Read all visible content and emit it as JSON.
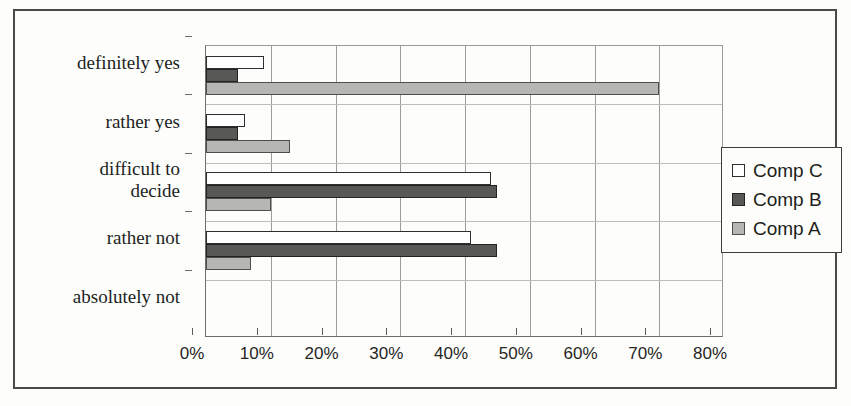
{
  "chart_data": {
    "type": "bar",
    "orientation": "horizontal",
    "title": "",
    "xlabel": "",
    "ylabel": "",
    "xlim": [
      0,
      80
    ],
    "xtick_labels": [
      "0%",
      "10%",
      "20%",
      "30%",
      "40%",
      "50%",
      "60%",
      "70%",
      "80%"
    ],
    "xtick_values": [
      0,
      10,
      20,
      30,
      40,
      50,
      60,
      70,
      80
    ],
    "grid": true,
    "grid_axis": "x",
    "legend_position": "right",
    "categories": [
      "definitely yes",
      "rather yes",
      "difficult to decide",
      "rather not",
      "absolutely not"
    ],
    "series": [
      {
        "name": "Comp C",
        "color": "#fefefe",
        "values": [
          9,
          6,
          44,
          41,
          0
        ]
      },
      {
        "name": "Comp B",
        "color": "#585856",
        "values": [
          5,
          5,
          45,
          45,
          0
        ]
      },
      {
        "name": "Comp A",
        "color": "#b6b6b2",
        "values": [
          70,
          13,
          10,
          7,
          0
        ]
      }
    ]
  },
  "legend": {
    "items": [
      {
        "label": "Comp C",
        "swatch": "series-c-swatch-icon"
      },
      {
        "label": "Comp B",
        "swatch": "series-b-swatch-icon"
      },
      {
        "label": "Comp A",
        "swatch": "series-a-swatch-icon"
      }
    ]
  }
}
